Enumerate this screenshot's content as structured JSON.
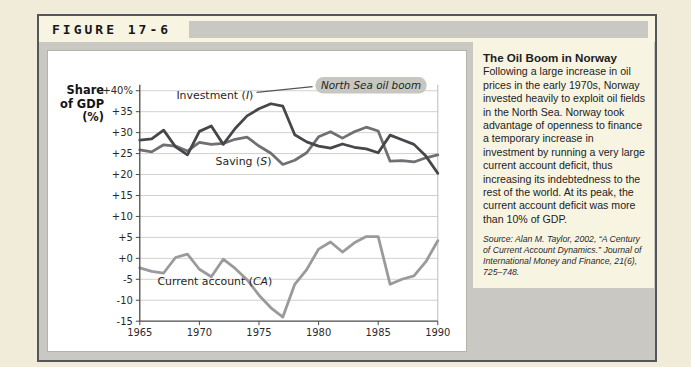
{
  "figure_label": "FIGURE 17-6",
  "caption": {
    "title": "The Oil Boom in Norway",
    "body": "Following a large increase in oil prices in the early 1970s, Norway invested heavily to exploit oil fields in the North Sea. Norway took advantage of openness to finance a temporary increase in investment by running a very large current account deficit, thus increasing its indebtedness to the rest of the world. At its peak, the current account deficit was more than 10% of GDP.",
    "source": "Source: Alan M. Taylor, 2002, “A Century of Current Account Dynamics.” Journal of International Money and Finance, 21(6), 725–748."
  },
  "colors": {
    "page_bg": "#f1ecda",
    "figure_mat": "#c9c8c2",
    "figure_border": "#55565a",
    "header_strip": "#f8f4e2",
    "chart_bg": "#ffffff",
    "caption_bg": "#f8f4e2",
    "gridline": "#d2d1cd",
    "axis": "#4a4a4a",
    "label_text": "#2a2a2c",
    "pill_bg": "#c7c6c0"
  },
  "chart_data": {
    "type": "line",
    "title": "",
    "ylabel_lines": [
      "Share",
      "of GDP",
      "(%)"
    ],
    "xlim": [
      1965,
      1990
    ],
    "ylim": [
      -15,
      40
    ],
    "grid": true,
    "legend_position": "none (inline series labels)",
    "x_ticks": [
      1965,
      1970,
      1975,
      1980,
      1985,
      1990
    ],
    "y_ticks": [
      40,
      35,
      30,
      25,
      20,
      15,
      10,
      5,
      0,
      -5,
      -10,
      -15
    ],
    "y_tick_labels": [
      "+40%",
      "+35",
      "+30",
      "+25",
      "+20",
      "+15",
      "+10",
      "+5",
      "+0",
      "-5",
      "-10",
      "-15"
    ],
    "x": [
      1965,
      1966,
      1967,
      1968,
      1969,
      1970,
      1971,
      1972,
      1973,
      1974,
      1975,
      1976,
      1977,
      1978,
      1979,
      1980,
      1981,
      1982,
      1983,
      1984,
      1985,
      1986,
      1987,
      1988,
      1989,
      1990
    ],
    "series": [
      {
        "name": "Investment (I)",
        "color": "#46464b",
        "width": 2.8,
        "values": [
          28.2,
          28.5,
          30.6,
          26.6,
          24.7,
          30.3,
          31.6,
          27.2,
          31.0,
          34.0,
          35.7,
          36.9,
          36.3,
          29.5,
          27.8,
          26.8,
          26.3,
          27.3,
          26.5,
          26.1,
          25.2,
          29.4,
          28.3,
          27.2,
          24.4,
          20.3
        ]
      },
      {
        "name": "Saving (S)",
        "color": "#6f6f74",
        "width": 2.8,
        "values": [
          25.9,
          25.4,
          27.1,
          26.8,
          25.6,
          27.7,
          27.2,
          27.4,
          28.4,
          28.9,
          26.8,
          25.1,
          22.4,
          23.4,
          25.2,
          29.0,
          30.2,
          28.7,
          30.2,
          31.3,
          30.4,
          23.2,
          23.3,
          23.0,
          24.0,
          24.7
        ]
      },
      {
        "name": "Current account (CA)",
        "color": "#9a9a9d",
        "width": 2.8,
        "values": [
          -2.3,
          -3.1,
          -3.5,
          0.2,
          1.0,
          -2.6,
          -4.4,
          -0.2,
          -2.4,
          -5.1,
          -8.8,
          -11.8,
          -14.0,
          -6.2,
          -2.7,
          2.2,
          3.9,
          1.5,
          3.7,
          5.2,
          5.2,
          -6.2,
          -5.0,
          -4.2,
          -0.8,
          4.2
        ]
      }
    ],
    "annotations": [
      {
        "style": "series-label",
        "text": "Investment (I)",
        "x": 1971.3,
        "y": 38.8
      },
      {
        "style": "series-label",
        "text": "Saving (S)",
        "x": 1973.7,
        "y": 23.0
      },
      {
        "style": "series-label",
        "text": "Current account (CA)",
        "x": 1971.3,
        "y": -5.6
      },
      {
        "style": "highlight",
        "text": "North Sea oil boom",
        "x": 1984.4,
        "y": 41.3,
        "pill_w": 112,
        "pill_h": 16.5,
        "connector_from": [
          1974.8,
          39.6
        ],
        "connector_to": [
          1979.5,
          41.0
        ]
      }
    ]
  }
}
